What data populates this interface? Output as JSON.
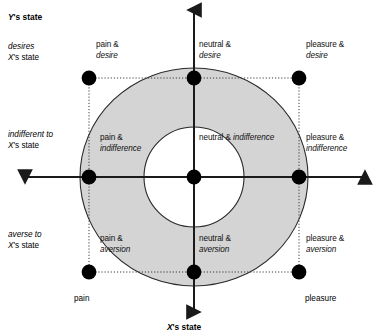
{
  "figure": {
    "type": "diagram",
    "subtype": "two-axis-quadrant-torus",
    "background_color": "#ffffff",
    "ring_fill_color": "#d4d4d4",
    "stroke_color": "#000000",
    "dot_color": "#000000"
  },
  "axes": {
    "y_title_parts": {
      "italic": "Y",
      "roman": "'s state"
    },
    "x_title_parts": {
      "italic": "X",
      "roman": "'s state"
    },
    "y_title_text": "Y's state",
    "x_title_text": "X's state",
    "y_row_labels": [
      {
        "line1": "desires",
        "line2_italic": "X",
        "line2_roman": "'s state"
      },
      {
        "line1": "indifferent to",
        "line2_italic": "X",
        "line2_roman": "'s state"
      },
      {
        "line1": "averse to",
        "line2_italic": "X",
        "line2_roman": "'s state"
      }
    ],
    "x_end_labels": {
      "left": "pain",
      "right": "pleasure"
    }
  },
  "cells": [
    {
      "id": "pain-desire",
      "roman": "pain &",
      "italic": "desire",
      "x": -1,
      "y": 1
    },
    {
      "id": "neutral-desire",
      "roman": "neutral &",
      "italic": "desire",
      "x": 0,
      "y": 1
    },
    {
      "id": "pleasure-desire",
      "roman": "pleasure &",
      "italic": "desire",
      "x": 1,
      "y": 1
    },
    {
      "id": "pain-indifference",
      "roman": "pain &",
      "italic": "indifference",
      "x": -1,
      "y": 0
    },
    {
      "id": "neutral-indifference",
      "roman": "neutral &",
      "italic": "indifference",
      "x": 0,
      "y": 0
    },
    {
      "id": "pleasure-indifference",
      "roman": "pleasure &",
      "italic": "indifference",
      "x": 1,
      "y": 0
    },
    {
      "id": "pain-aversion",
      "roman": "pain &",
      "italic": "aversion",
      "x": -1,
      "y": -1
    },
    {
      "id": "neutral-aversion",
      "roman": "neutral &",
      "italic": "aversion",
      "x": 0,
      "y": -1
    },
    {
      "id": "pleasure-aversion",
      "roman": "pleasure &",
      "italic": "aversion",
      "x": 1,
      "y": -1
    }
  ],
  "labels": {
    "y_state": "Y's state",
    "x_state": "X's state",
    "desires": "desires",
    "indifferent_to": "indifferent to",
    "averse_to": "averse to",
    "xs_state": "X's state",
    "pain_end": "pain",
    "pleasure_end": "pleasure",
    "pain_amp": "pain &",
    "neutral_amp": "neutral &",
    "pleasure_amp": "pleasure &",
    "desire": "desire",
    "indifference": "indifference",
    "aversion": "aversion",
    "neutral_indifference_inline": "neutral & indifference"
  }
}
